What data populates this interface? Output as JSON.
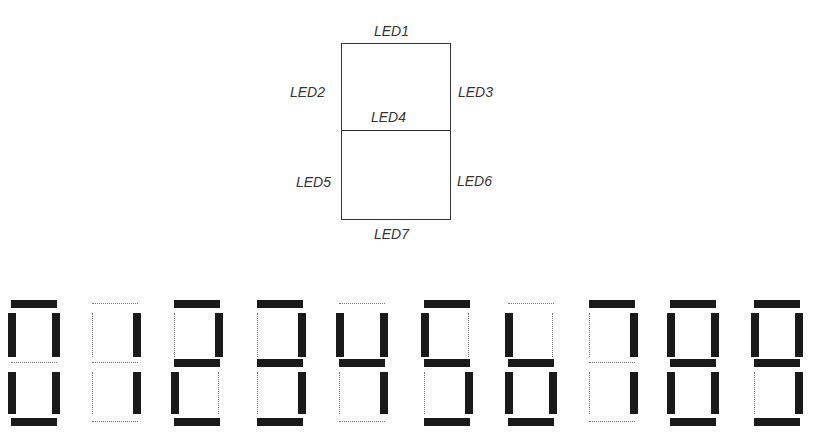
{
  "diagram": {
    "labels": {
      "led1": "LED1",
      "led2": "LED2",
      "led3": "LED3",
      "led4": "LED4",
      "led5": "LED5",
      "led6": "LED6",
      "led7": "LED7"
    }
  },
  "digits": [
    {
      "value": "0",
      "left": 8,
      "on": [
        1,
        2,
        3,
        5,
        6,
        7
      ]
    },
    {
      "value": "1",
      "left": 89,
      "on": [
        3,
        6
      ]
    },
    {
      "value": "2",
      "left": 171,
      "on": [
        1,
        3,
        4,
        5,
        7
      ]
    },
    {
      "value": "3",
      "left": 254,
      "on": [
        1,
        3,
        4,
        6,
        7
      ]
    },
    {
      "value": "4",
      "left": 336,
      "on": [
        2,
        3,
        4,
        6
      ]
    },
    {
      "value": "5",
      "left": 421,
      "on": [
        1,
        2,
        4,
        6,
        7
      ]
    },
    {
      "value": "6",
      "left": 505,
      "on": [
        2,
        4,
        5,
        6,
        7
      ]
    },
    {
      "value": "7",
      "left": 586,
      "on": [
        1,
        3,
        6
      ]
    },
    {
      "value": "8",
      "left": 667,
      "on": [
        1,
        2,
        3,
        4,
        5,
        6,
        7
      ]
    },
    {
      "value": "9",
      "left": 751,
      "on": [
        1,
        2,
        3,
        4,
        6,
        7
      ]
    }
  ],
  "colors": {
    "segment_on": "#1a1a1a",
    "segment_off": "#777777",
    "outline": "#333333"
  }
}
